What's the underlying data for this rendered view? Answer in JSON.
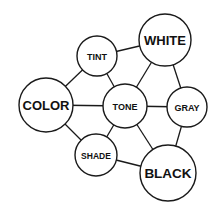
{
  "diagram": {
    "type": "concept-graph",
    "nodes": [
      {
        "id": "white",
        "label": "WHITE",
        "cx": 165,
        "cy": 40,
        "r": 26,
        "font": 13
      },
      {
        "id": "tint",
        "label": "TINT",
        "cx": 97,
        "cy": 56,
        "r": 20,
        "font": 9
      },
      {
        "id": "color",
        "label": "COLOR",
        "cx": 46,
        "cy": 105,
        "r": 27,
        "font": 13
      },
      {
        "id": "tone",
        "label": "TONE",
        "cx": 125,
        "cy": 106,
        "r": 22,
        "font": 9
      },
      {
        "id": "gray",
        "label": "GRAY",
        "cx": 187,
        "cy": 107,
        "r": 20,
        "font": 9
      },
      {
        "id": "shade",
        "label": "SHADE",
        "cx": 96,
        "cy": 155,
        "r": 21,
        "font": 8.5
      },
      {
        "id": "black",
        "label": "BLACK",
        "cx": 168,
        "cy": 173,
        "r": 28,
        "font": 13.5
      }
    ],
    "edges": [
      [
        "tint",
        "white"
      ],
      [
        "tint",
        "color"
      ],
      [
        "tint",
        "tone"
      ],
      [
        "white",
        "tone"
      ],
      [
        "white",
        "gray"
      ],
      [
        "color",
        "tone"
      ],
      [
        "color",
        "shade"
      ],
      [
        "tone",
        "gray"
      ],
      [
        "tone",
        "shade"
      ],
      [
        "tone",
        "black"
      ],
      [
        "gray",
        "black"
      ],
      [
        "shade",
        "black"
      ]
    ]
  }
}
